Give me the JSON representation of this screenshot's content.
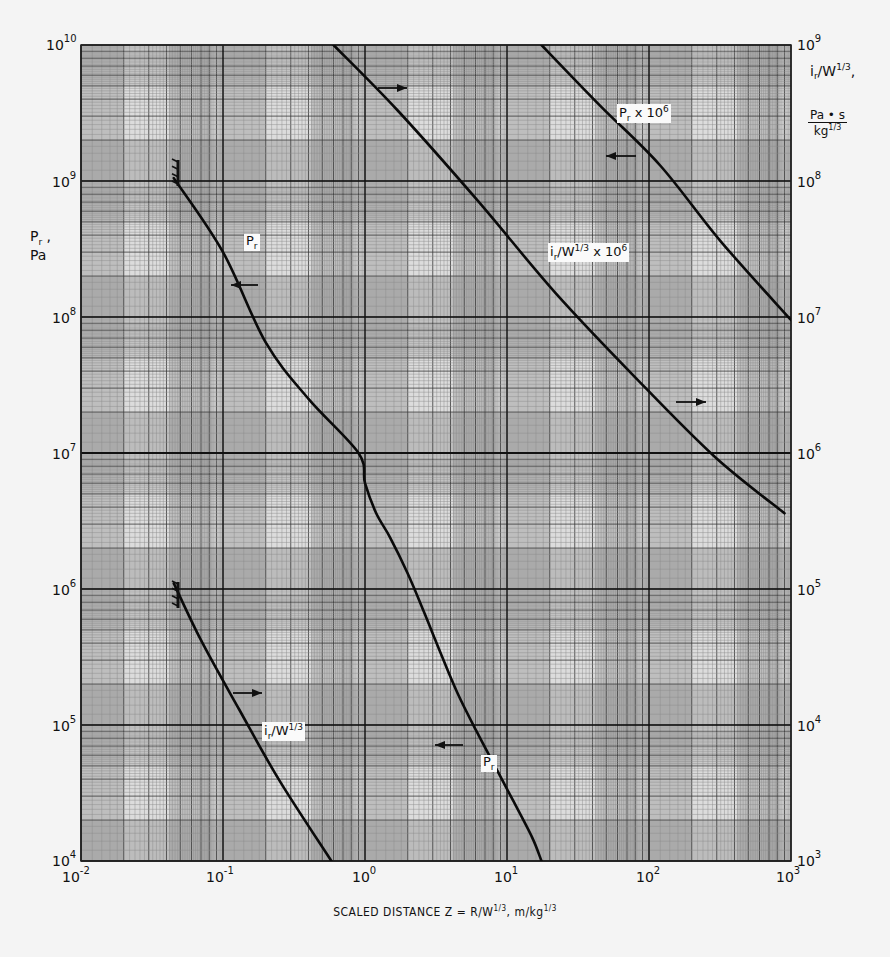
{
  "chart_data": {
    "type": "line",
    "scale": {
      "x": "log",
      "y_left": "log",
      "y_right": "log"
    },
    "xlabel": "SCALED DISTANCE  Z = R/W^1/3, m/kg^1/3",
    "ylabel_left": "Pr, Pa",
    "ylabel_right": "ir/W^1/3, Pa·s/kg^1/3",
    "xlim": [
      0.01,
      1000
    ],
    "ylim_left": [
      10000,
      10000000000
    ],
    "ylim_right": [
      1000,
      1000000000
    ],
    "x_ticks": [
      "10^-2",
      "10^-1",
      "10^0",
      "10^1",
      "10^2",
      "10^3"
    ],
    "y_left_ticks": [
      "10^10",
      "10^9",
      "10^8",
      "10^7",
      "10^6",
      "10^5",
      "10^4"
    ],
    "y_right_ticks": [
      "10^9",
      "10^8",
      "10^7",
      "10^6",
      "10^5",
      "10^4",
      "10^3"
    ],
    "grid": true,
    "series": [
      {
        "name": "Pr",
        "axis": "left",
        "label": "Pr",
        "arrow": "left",
        "points": [
          [
            0.045,
            1050000000.0
          ],
          [
            0.1,
            300000000.0
          ],
          [
            0.2,
            65000000.0
          ],
          [
            0.4,
            25000000.0
          ],
          [
            0.9,
            10000000.0
          ],
          [
            1.0,
            6000000.0
          ],
          [
            1.2,
            3600000.0
          ],
          [
            1.5,
            2400000.0
          ],
          [
            2.0,
            1300000.0
          ],
          [
            2.6,
            680000.0
          ],
          [
            3.4,
            340000.0
          ],
          [
            4.5,
            170000.0
          ],
          [
            6.1,
            90000.0
          ],
          [
            8.2,
            50000.0
          ],
          [
            11,
            28000.0
          ],
          [
            15,
            15000.0
          ],
          [
            17.5,
            10000.0
          ]
        ]
      },
      {
        "name": "Pr x 10^6",
        "axis": "left",
        "label": "Pr x 10^6",
        "arrow": "left",
        "multiplier": 1000000,
        "points": [
          [
            17.5,
            10000000000.0
          ],
          [
            45,
            3600000000.0
          ],
          [
            120,
            1300000000.0
          ],
          [
            320,
            360000000.0
          ],
          [
            1000,
            95000000.0
          ]
        ]
      },
      {
        "name": "ir/W^1/3",
        "axis": "right",
        "label": "ir/W^1/3",
        "arrow": "right",
        "points": [
          [
            0.045,
            110000.0
          ],
          [
            0.07,
            42000.0
          ],
          [
            0.13,
            13000.0
          ],
          [
            0.25,
            3900.0
          ],
          [
            0.58,
            1000.0
          ]
        ]
      },
      {
        "name": "ir/W^1/3 x 10^6",
        "axis": "right",
        "label": "ir/W^1/3 x 10^6",
        "arrow": "right",
        "multiplier": 1000000,
        "points": [
          [
            0.6,
            1000000000.0
          ],
          [
            1.7,
            330000000.0
          ],
          [
            6.2,
            72000000.0
          ],
          [
            22,
            15000000.0
          ],
          [
            80,
            3600000.0
          ],
          [
            290,
            940000.0
          ],
          [
            900,
            360000.0
          ]
        ]
      }
    ]
  },
  "labels": {
    "y_left_title_main": "P",
    "y_left_title_sub": "r",
    "y_left_title_sep": " ,",
    "y_left_title_unit": "Pa",
    "y_right_title_i": "i",
    "y_right_title_sub": "r",
    "y_right_title_rest": "/W",
    "y_right_title_sup": "1/3",
    "y_right_title_comma": ",",
    "y_right_unit_num": "Pa • s",
    "y_right_unit_den": "kg",
    "y_right_unit_den_sup": "1/3",
    "x_title_a": "SCALED DISTANCE   Z = R/W",
    "x_title_sup1": "1/3",
    "x_title_b": ", m/kg",
    "x_title_sup2": "1/3",
    "curve_pr_main": "P",
    "curve_pr_sub": "r",
    "curve_ir_main": "i",
    "curve_ir_sub": "r",
    "curve_ir_rest": "/W",
    "curve_ir_sup": "1/3",
    "curve_prx_main": "P",
    "curve_prx_sub": "r",
    "curve_prx_rest": " x 10",
    "curve_prx_sup": "6",
    "curve_irx_main": "i",
    "curve_irx_sub": "r",
    "curve_irx_rest": "/W",
    "curve_irx_sup": "1/3",
    "curve_irx_tail": " x 10",
    "curve_irx_tail_sup": "6",
    "base": "10"
  },
  "ticks": {
    "x": [
      {
        "exp": "-2",
        "left": 62
      },
      {
        "exp": "-1",
        "left": 206
      },
      {
        "exp": "0",
        "left": 352
      },
      {
        "exp": "1",
        "left": 494
      },
      {
        "exp": "2",
        "left": 636
      },
      {
        "exp": "3",
        "left": 776
      }
    ],
    "y_left": [
      {
        "exp": "10",
        "top": 36
      },
      {
        "exp": "9",
        "top": 173
      },
      {
        "exp": "8",
        "top": 309
      },
      {
        "exp": "7",
        "top": 445
      },
      {
        "exp": "6",
        "top": 581
      },
      {
        "exp": "5",
        "top": 717
      },
      {
        "exp": "4",
        "top": 852
      }
    ],
    "y_right": [
      {
        "exp": "9",
        "top": 36
      },
      {
        "exp": "8",
        "top": 173
      },
      {
        "exp": "7",
        "top": 309
      },
      {
        "exp": "6",
        "top": 445
      },
      {
        "exp": "5",
        "top": 581
      },
      {
        "exp": "4",
        "top": 717
      },
      {
        "exp": "3",
        "top": 852
      }
    ]
  },
  "colors": {
    "paper": "#f4f4f4",
    "grid_minor": "#7a7a7a",
    "grid_major": "#222222",
    "curve": "#0a0a0a"
  }
}
